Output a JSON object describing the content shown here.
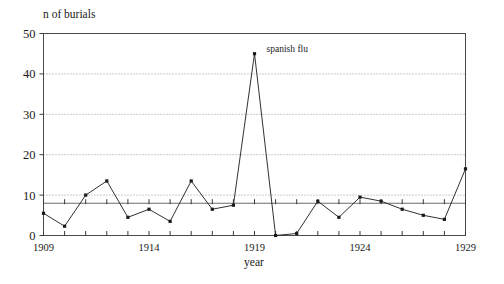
{
  "chart_data": {
    "type": "line",
    "title": "",
    "ylabel": "n of burials",
    "xlabel": "year",
    "xlim": [
      1909,
      1929
    ],
    "ylim": [
      0,
      50
    ],
    "yticks": [
      0,
      10,
      20,
      30,
      40,
      50
    ],
    "ytick_labels": [
      "0",
      "10",
      "20",
      "30",
      "40",
      "50"
    ],
    "xticks": [
      1909,
      1910,
      1911,
      1912,
      1913,
      1914,
      1915,
      1916,
      1917,
      1918,
      1919,
      1920,
      1921,
      1922,
      1923,
      1924,
      1925,
      1926,
      1927,
      1928,
      1929
    ],
    "xtick_labels": [
      "1909",
      "1914",
      "1919",
      "1924",
      "1929"
    ],
    "xtick_label_years": [
      1909,
      1914,
      1919,
      1924,
      1929
    ],
    "grid": "horizontal-dotted",
    "legend": "none",
    "reference_line": {
      "value": 8,
      "style": "solid",
      "has_ticks": true
    },
    "x": [
      1909,
      1910,
      1911,
      1912,
      1913,
      1914,
      1915,
      1916,
      1917,
      1918,
      1919,
      1920,
      1921,
      1922,
      1923,
      1924,
      1925,
      1926,
      1927,
      1928,
      1929
    ],
    "values": [
      5.5,
      2.3,
      10.0,
      13.5,
      4.5,
      6.5,
      3.5,
      13.5,
      6.5,
      7.5,
      45.0,
      0.0,
      0.5,
      8.5,
      4.5,
      9.5,
      8.5,
      6.5,
      5.0,
      4.0,
      16.5
    ],
    "annotations": [
      {
        "text": "spanish flu",
        "x": 1919,
        "y": 45.0,
        "label_offset_x": 12,
        "label_offset_y": -2
      }
    ],
    "colors": {
      "line": "#1a1a1a",
      "marker": "#1a1a1a",
      "grid": "#8d8d8d",
      "frame": "#4a4a4a",
      "reference": "#6b6b6b",
      "background": "#ffffff"
    }
  }
}
